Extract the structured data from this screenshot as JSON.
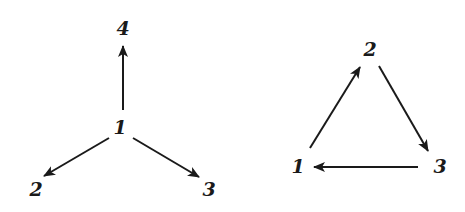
{
  "graphs": [
    {
      "name": "star",
      "nodes": [
        {
          "id": "1",
          "label": "1",
          "x": 120,
          "y": 134
        },
        {
          "id": "2",
          "label": "2",
          "x": 36,
          "y": 196
        },
        {
          "id": "3",
          "label": "3",
          "x": 209,
          "y": 196
        },
        {
          "id": "4",
          "label": "4",
          "x": 123,
          "y": 35
        }
      ],
      "edges": [
        {
          "from": "1",
          "to": "4",
          "x1": 123,
          "y1": 110,
          "x2": 123,
          "y2": 46
        },
        {
          "from": "1",
          "to": "2",
          "x1": 109,
          "y1": 138,
          "x2": 44,
          "y2": 176
        },
        {
          "from": "1",
          "to": "3",
          "x1": 133,
          "y1": 138,
          "x2": 199,
          "y2": 177
        }
      ]
    },
    {
      "name": "cycle",
      "nodes": [
        {
          "id": "1",
          "label": "1",
          "x": 298,
          "y": 173
        },
        {
          "id": "2",
          "label": "2",
          "x": 370,
          "y": 56
        },
        {
          "id": "3",
          "label": "3",
          "x": 440,
          "y": 173
        }
      ],
      "edges": [
        {
          "from": "1",
          "to": "2",
          "x1": 310,
          "y1": 148,
          "x2": 360,
          "y2": 67
        },
        {
          "from": "2",
          "to": "3",
          "x1": 379,
          "y1": 66,
          "x2": 428,
          "y2": 151
        },
        {
          "from": "3",
          "to": "1",
          "x1": 418,
          "y1": 167,
          "x2": 314,
          "y2": 167
        }
      ]
    }
  ]
}
